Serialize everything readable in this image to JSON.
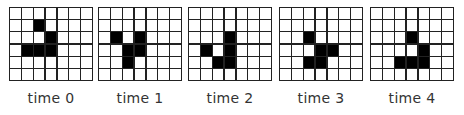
{
  "diagram": {
    "rows": 6,
    "cols": 7,
    "frames": [
      {
        "label": "time 0",
        "x": 9,
        "alive": [
          [
            1,
            2
          ],
          [
            2,
            3
          ],
          [
            3,
            1
          ],
          [
            3,
            2
          ],
          [
            3,
            3
          ]
        ]
      },
      {
        "label": "time 1",
        "x": 98,
        "alive": [
          [
            2,
            1
          ],
          [
            2,
            3
          ],
          [
            3,
            2
          ],
          [
            3,
            3
          ],
          [
            4,
            2
          ]
        ]
      },
      {
        "label": "time 2",
        "x": 188,
        "alive": [
          [
            2,
            3
          ],
          [
            3,
            1
          ],
          [
            3,
            3
          ],
          [
            4,
            2
          ],
          [
            4,
            3
          ]
        ]
      },
      {
        "label": "time 3",
        "x": 279,
        "alive": [
          [
            2,
            2
          ],
          [
            3,
            3
          ],
          [
            3,
            4
          ],
          [
            4,
            2
          ],
          [
            4,
            3
          ]
        ]
      },
      {
        "label": "time 4",
        "x": 370,
        "alive": [
          [
            2,
            3
          ],
          [
            3,
            4
          ],
          [
            4,
            2
          ],
          [
            4,
            3
          ],
          [
            4,
            4
          ]
        ]
      }
    ],
    "colors": {
      "alive": "#000000",
      "dead": "#ffffff",
      "gridline": "#222222"
    }
  }
}
